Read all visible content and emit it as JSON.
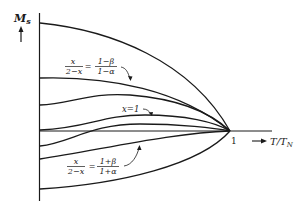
{
  "figure": {
    "y_axis_label": "M",
    "y_axis_subscript": "s",
    "x_axis_label": "T/T",
    "x_axis_subscript": "N",
    "x_tick": "1",
    "annotation_upper": {
      "lhs_num": "x",
      "lhs_den": "2−x",
      "eq": "=",
      "rhs_num": "1−β",
      "rhs_den": "1−α"
    },
    "annotation_middle": "x=1",
    "annotation_lower": {
      "lhs_num": "x",
      "lhs_den": "2−x",
      "eq": "=",
      "rhs_num": "1+β",
      "rhs_den": "1+α"
    },
    "curve_color": "#1a1a1a"
  }
}
